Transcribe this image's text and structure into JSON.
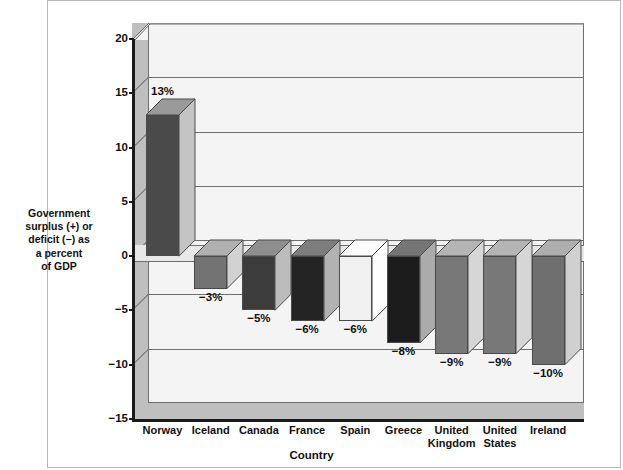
{
  "chart_data": {
    "type": "bar",
    "title": "",
    "xlabel": "Country",
    "ylabel": "Government surplus (+) or deficit (−) as a percent of GDP",
    "ylabel_lines": [
      "Government",
      "surplus (+) or",
      "deficit (−) as",
      "a percent",
      "of GDP"
    ],
    "categories": [
      "Norway",
      "Iceland",
      "Canada",
      "France",
      "Spain",
      "Greece",
      "United Kingdom",
      "United States",
      "Ireland"
    ],
    "category_label_lines": [
      [
        "Norway"
      ],
      [
        "Iceland"
      ],
      [
        "Canada"
      ],
      [
        "France"
      ],
      [
        "Spain"
      ],
      [
        "Greece"
      ],
      [
        "United",
        "Kingdom"
      ],
      [
        "United",
        "States"
      ],
      [
        "Ireland"
      ]
    ],
    "values": [
      13,
      -3,
      -5,
      -6,
      -6,
      -8,
      -9,
      -9,
      -10
    ],
    "data_labels": [
      "13%",
      "−3%",
      "−5%",
      "−6%",
      "−6%",
      "−8%",
      "−9%",
      "−9%",
      "−10%"
    ],
    "ylim": [
      -15,
      20
    ],
    "yticks": [
      20,
      15,
      10,
      5,
      0,
      -5,
      -10,
      -15
    ],
    "ytick_labels": [
      "20",
      "15",
      "10",
      "5",
      "0",
      "−5",
      "−10",
      "−15"
    ],
    "grid": true,
    "legend": "none",
    "bar_colors": [
      "#4a4a4a",
      "#737373",
      "#3c3c3c",
      "#242424",
      "#f0f0f0",
      "#1c1c1c",
      "#787878",
      "#787878",
      "#6f6f6f"
    ],
    "bar_top_colors": [
      "#9a9a9a",
      "#b0b0b0",
      "#8e8e8e",
      "#7d7d7d",
      "#fbfbfb",
      "#767676",
      "#b4b4b4",
      "#b4b4b4",
      "#aeaeae"
    ],
    "bar_side_colors": [
      "#c4c4c4",
      "#d2d2d2",
      "#bcbcbc",
      "#b2b2b2",
      "#fdfdfd",
      "#ababab",
      "#d6d6d6",
      "#d6d6d6",
      "#d0d0d0"
    ]
  },
  "style": {
    "panel_background": "#f4f4f4",
    "wall_color": "#bfbfbf",
    "axis_color": "#1a1a1a",
    "grid_color": "#6e6e6e",
    "page_background": "#ffffff"
  }
}
